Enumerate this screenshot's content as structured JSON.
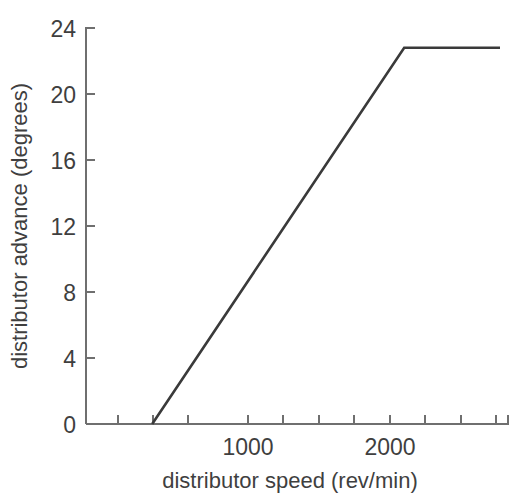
{
  "chart_data": {
    "type": "line",
    "title": "",
    "subtitle": "",
    "xlabel": "distributor speed (rev/min)",
    "ylabel": "distributor advance (degrees)",
    "xlim": [
      0,
      2960
    ],
    "ylim": [
      0,
      24
    ],
    "grid": false,
    "legend": "none",
    "x_major_ticks": [
      1000,
      2000
    ],
    "x_major_tick_labels": [
      "1000",
      "2000"
    ],
    "x_minor_ticks": [
      250,
      500,
      750,
      1250,
      1500,
      1750,
      2250,
      2500,
      2750
    ],
    "y_ticks": [
      0,
      4,
      8,
      12,
      16,
      20,
      24
    ],
    "y_tick_labels": [
      "0",
      "4",
      "8",
      "12",
      "16",
      "20",
      "24"
    ],
    "series": [
      {
        "name": "distributor advance",
        "color": "#3a3a3a",
        "x": [
          325,
          2100,
          2775
        ],
        "y": [
          0,
          22.8,
          22.8
        ],
        "points": [
          {
            "x": 325,
            "y": 0,
            "note": "advance begins"
          },
          {
            "x": 2100,
            "y": 22.8,
            "note": "knee - maximum advance reached"
          },
          {
            "x": 2775,
            "y": 22.8,
            "note": "plateau end"
          }
        ]
      }
    ],
    "annotations": []
  },
  "axes": {
    "y_axis_label": "distributor advance (degrees)",
    "x_axis_label": "distributor speed (rev/min)"
  },
  "colors": {
    "background": "#ffffff",
    "axis": "#6f6f6f",
    "text": "#3f3f3f",
    "data_line": "#3a3a3a"
  }
}
